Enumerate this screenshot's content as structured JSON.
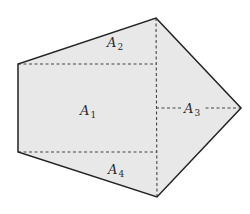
{
  "diagram": {
    "type": "pentagon-area-decomposition",
    "fill_color": "#e8e8e8",
    "outline_color": "#222222",
    "dash_color": "#444444",
    "vertices": [
      {
        "name": "top",
        "x": 156,
        "y": 18
      },
      {
        "name": "right",
        "x": 241,
        "y": 108
      },
      {
        "name": "bottom",
        "x": 157,
        "y": 197
      },
      {
        "name": "bottom-left",
        "x": 18,
        "y": 152
      },
      {
        "name": "top-left",
        "x": 18,
        "y": 64
      }
    ],
    "regions": [
      {
        "id": "A1",
        "letter": "A",
        "sub": "1",
        "x": 80,
        "y": 115
      },
      {
        "id": "A2",
        "letter": "A",
        "sub": "2",
        "x": 107,
        "y": 47
      },
      {
        "id": "A3",
        "letter": "A",
        "sub": "3",
        "x": 184,
        "y": 113
      },
      {
        "id": "A4",
        "letter": "A",
        "sub": "4",
        "x": 108,
        "y": 174
      }
    ]
  }
}
